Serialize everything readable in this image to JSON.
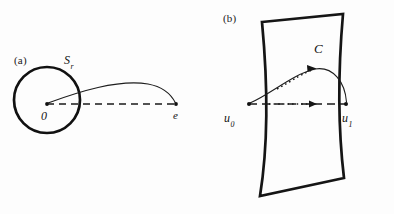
{
  "figure": {
    "background_color": "#fdfdfd",
    "ink_color": "#121212",
    "panels": [
      {
        "id": "a",
        "label": "(a)",
        "description": "circle of radius r centered at origin with a curve from the origin to a point e outside the circle",
        "labels": {
          "sphere": "S",
          "sphere_subscript": "r",
          "origin": "0",
          "endpoint": "e"
        },
        "geometry": {
          "circle_center_x": 47,
          "circle_center_y": 100,
          "circle_radius": 33,
          "circle_stroke_width": 2.6,
          "origin_point": [
            47,
            104
          ],
          "endpoint_point": [
            176,
            104
          ],
          "dashed_line_dash": "7,5",
          "curve_control": [
            120,
            72
          ]
        }
      },
      {
        "id": "b",
        "label": "(b)",
        "description": "a curved strip region C crossed by a geodesic arc from u0 to u1 and a dashed straight chord",
        "labels": {
          "region": "C",
          "start_point": "u",
          "start_subscript": "0",
          "end_point": "u",
          "end_subscript": "1"
        },
        "geometry": {
          "start_point": [
            52,
            104
          ],
          "end_point": [
            148,
            104
          ],
          "arc_apex": [
            117,
            68
          ],
          "strip_stroke_width": 2.6,
          "dashed_line_dash": "8,5",
          "dotted_dash": "1.6,3"
        }
      }
    ]
  }
}
